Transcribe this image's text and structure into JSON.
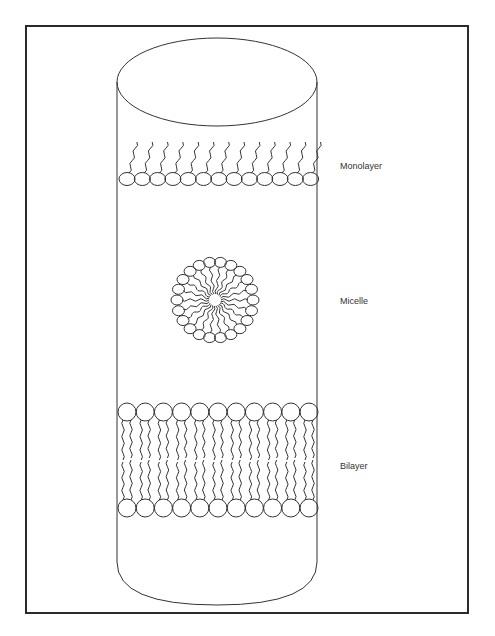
{
  "figure": {
    "type": "diagram",
    "labels": {
      "monolayer": "Monolayer",
      "micelle": "Micelle",
      "bilayer": "Bilayer"
    },
    "colors": {
      "stroke": "#333333",
      "frame": "#2a2a2a",
      "background": "#ffffff"
    },
    "monolayer": {
      "head_count": 13,
      "heads_row_y": 179
    },
    "micelle": {
      "head_count": 22,
      "center": [
        215,
        300
      ]
    },
    "bilayer": {
      "heads_per_leaflet": 11,
      "top_row_y": 412,
      "bottom_row_y": 508
    }
  }
}
